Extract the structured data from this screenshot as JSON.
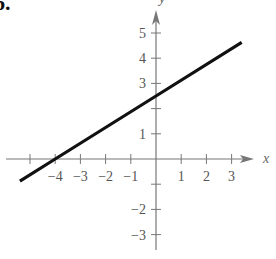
{
  "problem_number": "6.",
  "chart_data": {
    "type": "line",
    "title": "",
    "xlabel": "x",
    "ylabel": "y",
    "xlim": [
      -5.4,
      4.0
    ],
    "ylim": [
      -3.4,
      5.9
    ],
    "grid": false,
    "legend": null,
    "x_ticks": [
      -4,
      -3,
      -2,
      -1,
      1,
      2,
      3
    ],
    "x_tick_labels": [
      "−4",
      "−3",
      "−2",
      "−1",
      "1",
      "2",
      "3"
    ],
    "y_ticks": [
      5,
      4,
      3,
      2,
      1,
      -1,
      -2,
      -3
    ],
    "y_tick_labels": [
      "5",
      "4",
      "3",
      "",
      "1",
      "",
      "−2",
      "−3"
    ],
    "series": [
      {
        "name": "line",
        "x": [
          -5.4,
          -4,
          0,
          3.4
        ],
        "y": [
          -0.88,
          0,
          2.5,
          4.63
        ],
        "slope": 0.625,
        "x_intercept": -4,
        "y_intercept": 2.5
      }
    ]
  },
  "colors": {
    "axis": "#777777",
    "line": "#111111",
    "text": "#555555"
  }
}
